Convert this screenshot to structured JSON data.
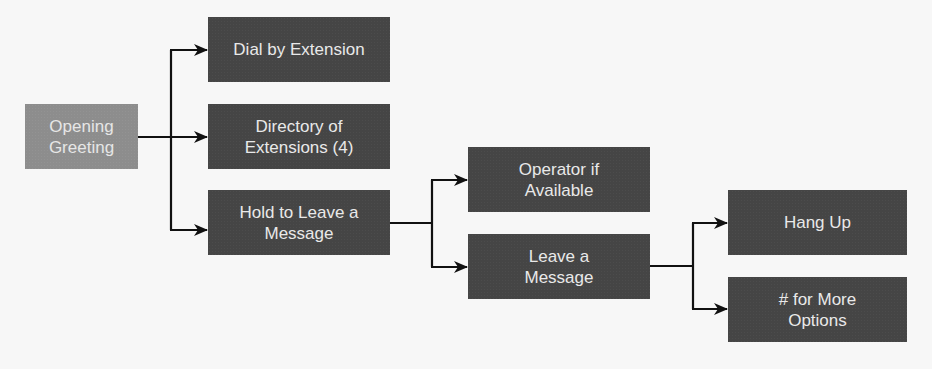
{
  "diagram": {
    "type": "flowchart",
    "colors": {
      "background": "#f7f7f7",
      "root_node": "#8d8d8d",
      "node": "#454545",
      "node_text": "#e9e9e9",
      "connector": "#111111"
    },
    "nodes": {
      "opening_greeting": {
        "label": "Opening\nGreeting"
      },
      "dial_by_extension": {
        "label": "Dial by Extension"
      },
      "directory_of_extensions": {
        "label": "Directory of\nExtensions (4)"
      },
      "hold_to_leave_message": {
        "label": "Hold to Leave a\nMessage"
      },
      "operator_if_available": {
        "label": "Operator if\nAvailable"
      },
      "leave_a_message": {
        "label": "Leave a\nMessage"
      },
      "hang_up": {
        "label": "Hang Up"
      },
      "more_options": {
        "label": "# for More\nOptions"
      }
    },
    "edges": [
      {
        "from": "opening_greeting",
        "to": "dial_by_extension"
      },
      {
        "from": "opening_greeting",
        "to": "directory_of_extensions"
      },
      {
        "from": "opening_greeting",
        "to": "hold_to_leave_message"
      },
      {
        "from": "hold_to_leave_message",
        "to": "operator_if_available"
      },
      {
        "from": "hold_to_leave_message",
        "to": "leave_a_message"
      },
      {
        "from": "leave_a_message",
        "to": "hang_up"
      },
      {
        "from": "leave_a_message",
        "to": "more_options"
      }
    ]
  }
}
